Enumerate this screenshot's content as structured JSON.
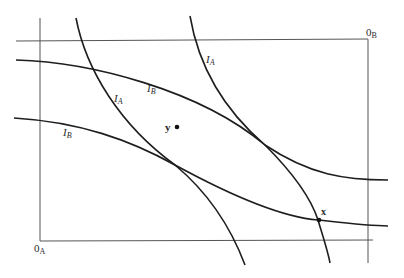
{
  "diagram": {
    "type": "edgeworth-box",
    "origin_a": {
      "label": "0",
      "sub": "A",
      "x": 34,
      "y": 252
    },
    "origin_b": {
      "label": "0",
      "sub": "B",
      "x": 368,
      "y": 36
    },
    "box": {
      "left": 40,
      "top": 41,
      "right": 368,
      "bottom": 241
    },
    "curves": [
      {
        "id": "ib-upper",
        "label": "I",
        "sub": "B",
        "label_x": 147,
        "label_y": 92,
        "path": "M16,60 C90,62 200,90 265,145 C310,175 345,180 388,180"
      },
      {
        "id": "ib-lower",
        "label": "I",
        "sub": "B",
        "label_x": 63,
        "label_y": 136,
        "path": "M14,118 C80,122 130,140 175,165 C230,195 280,217 318,220 C345,223 370,226 388,226"
      },
      {
        "id": "ia-left",
        "label": "I",
        "sub": "A",
        "label_x": 114,
        "label_y": 102,
        "path": "M76,18 C86,70 120,125 175,165 C205,190 230,225 245,265"
      },
      {
        "id": "ia-right",
        "label": "I",
        "sub": "A",
        "label_x": 206,
        "label_y": 63,
        "path": "M190,16 C200,75 230,115 265,145 C290,170 310,195 318,220 C324,240 328,252 330,263"
      }
    ],
    "points": [
      {
        "id": "y",
        "label": "y",
        "x": 177,
        "y": 127,
        "label_x": 165,
        "label_y": 131
      },
      {
        "id": "x",
        "label": "x",
        "x": 319,
        "y": 220,
        "label_x": 321,
        "label_y": 215
      }
    ]
  }
}
